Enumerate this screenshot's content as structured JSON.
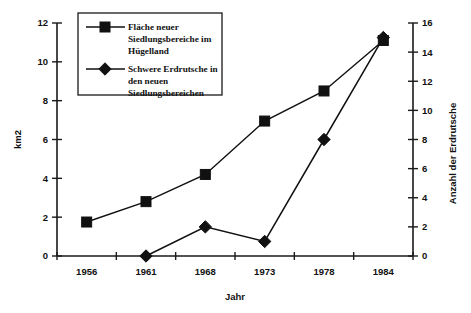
{
  "chart_data": {
    "type": "line",
    "title": "",
    "subtitle": "",
    "xlabel": "Jahr",
    "ylabel": "km2",
    "y2label": "Anzahl der Erdrutsche",
    "categories": [
      "1956",
      "1961",
      "1968",
      "1973",
      "1978",
      "1984"
    ],
    "x": [
      1956,
      1961,
      1968,
      1973,
      1978,
      1984
    ],
    "ylim": [
      0,
      12
    ],
    "y2lim": [
      0,
      16
    ],
    "yticks": [
      0,
      2,
      4,
      6,
      8,
      10,
      12
    ],
    "y2ticks": [
      0,
      2,
      4,
      6,
      8,
      10,
      12,
      14,
      16
    ],
    "ytick_labels": [
      "0",
      "2",
      "4",
      "6",
      "8",
      "10",
      "12"
    ],
    "y2tick_labels": [
      "0",
      "2",
      "4",
      "6",
      "8",
      "10",
      "12",
      "14",
      "16"
    ],
    "grid": false,
    "legend_position": "top-left",
    "series": [
      {
        "name": "Fläche neuer Siedlungsbereiche im Hügelland",
        "axis": "left",
        "marker": "square",
        "color": "#111111",
        "values": [
          1.75,
          2.8,
          4.2,
          6.95,
          8.5,
          11.1
        ]
      },
      {
        "name": "Schwere Erdrutsche in den neuen Siedlungsbereichen",
        "axis": "right",
        "marker": "diamond",
        "color": "#111111",
        "values": [
          null,
          0,
          2,
          1,
          8,
          15
        ]
      }
    ],
    "annotations": []
  },
  "legend": {
    "entries": [
      {
        "marker": "square",
        "lines": [
          "Fläche neuer",
          "Siedlungsbereiche im",
          "Hügelland"
        ]
      },
      {
        "marker": "diamond",
        "lines": [
          "Schwere Erdrutsche in",
          "den neuen",
          "Siedlungsbereichen"
        ]
      }
    ]
  },
  "axes": {
    "left_title": "km2",
    "right_title": "Anzahl der Erdrutsche",
    "bottom_title": "Jahr"
  }
}
